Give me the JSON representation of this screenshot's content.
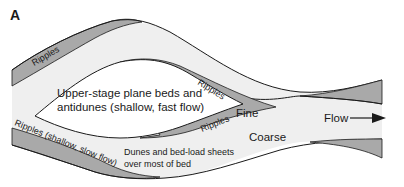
{
  "figure": {
    "panel_label": "A",
    "colors": {
      "background": "#ffffff",
      "channel_fill": "#efefef",
      "ripple_band_fill": "#a9a9a9",
      "bar_fill": "#ffffff",
      "outline": "#1a1a1a",
      "text": "#1a1a1a"
    },
    "labels": {
      "ripples_upper_left": "Ripples",
      "ripples_bar_top": "Ripples",
      "ripples_bar_bottom": "Ripples",
      "ripples_lower_left": "Ripples (shallow, slow flow)",
      "bar_line1": "Upper-stage plane beds and",
      "bar_line2": "antidunes (shallow, fast flow)",
      "fine": "Fine",
      "coarse": "Coarse",
      "dunes_line1": "Dunes and bed-load sheets",
      "dunes_line2": "over most of bed",
      "flow": "Flow"
    },
    "icons": {
      "flow_arrow": "arrow-right-icon"
    }
  }
}
